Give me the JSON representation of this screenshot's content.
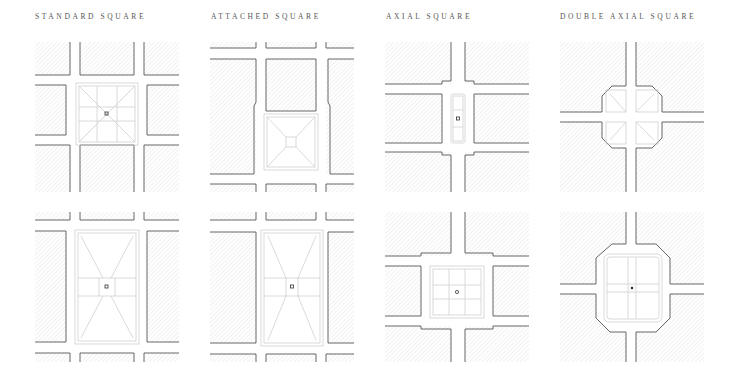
{
  "figure": {
    "columns": [
      {
        "title": "STANDARD SQUARE",
        "x": 35
      },
      {
        "title": "ATTACHED SQUARE",
        "x": 211
      },
      {
        "title": "AXIAL SQUARE",
        "x": 386
      },
      {
        "title": "DOUBLE AXIAL SQUARE",
        "x": 560
      }
    ],
    "rows": [
      {
        "y": 42,
        "variant": "square"
      },
      {
        "y": 212,
        "variant": "elongated"
      }
    ],
    "panels": [
      {
        "id": "standard-square-square",
        "column": "STANDARD SQUARE",
        "row": 1
      },
      {
        "id": "attached-square-square",
        "column": "ATTACHED SQUARE",
        "row": 1
      },
      {
        "id": "axial-square-square",
        "column": "AXIAL SQUARE",
        "row": 1
      },
      {
        "id": "double-axial-square-square",
        "column": "DOUBLE AXIAL SQUARE",
        "row": 1
      },
      {
        "id": "standard-square-elongated",
        "column": "STANDARD SQUARE",
        "row": 2
      },
      {
        "id": "attached-square-elongated",
        "column": "ATTACHED SQUARE",
        "row": 2
      },
      {
        "id": "axial-square-large",
        "column": "AXIAL SQUARE",
        "row": 2
      },
      {
        "id": "double-axial-square-large",
        "column": "DOUBLE AXIAL SQUARE",
        "row": 2
      }
    ],
    "colors": {
      "block_edge": "#555555",
      "hatch": "#d4d4d4",
      "plaza_line": "#cfcfcf",
      "background": "#ffffff",
      "label": "#555555"
    }
  }
}
